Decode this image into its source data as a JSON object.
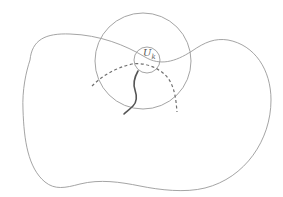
{
  "diagram": {
    "type": "topology-neighborhood-figure",
    "labels": {
      "small_circle_label": "U",
      "small_circle_subscript": "k"
    },
    "elements": [
      {
        "name": "outer-region",
        "style": "thin-solid",
        "color": "#9a9a9a"
      },
      {
        "name": "large-circle",
        "style": "thin-solid",
        "color": "#9a9a9a",
        "center": [
          143,
          61
        ],
        "radius": 48
      },
      {
        "name": "small-circle",
        "style": "thin-solid",
        "color": "#9a9a9a",
        "center": [
          147,
          60
        ],
        "radius": 13
      },
      {
        "name": "dashed-arc",
        "style": "dashed",
        "color": "#707070"
      },
      {
        "name": "thick-curve",
        "style": "thick-solid",
        "color": "#555555"
      }
    ],
    "colors": {
      "background": "#ffffff",
      "thin_line": "#9a9a9a",
      "dashed_line": "#707070",
      "thick_line": "#555555",
      "label": "#555555"
    }
  }
}
